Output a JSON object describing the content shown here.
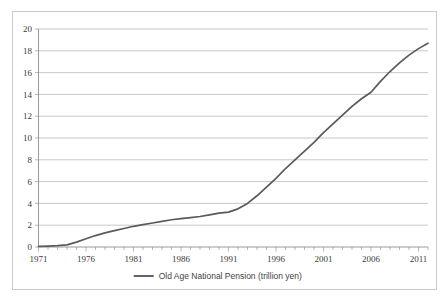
{
  "chart_data": {
    "type": "line",
    "title": "",
    "xlabel": "",
    "ylabel": "",
    "xlim": [
      1971,
      2012
    ],
    "ylim": [
      0,
      20
    ],
    "y_ticks": [
      0,
      2,
      4,
      6,
      8,
      10,
      12,
      14,
      16,
      18,
      20
    ],
    "x_tick_labels": [
      "1971",
      "1976",
      "1981",
      "1986",
      "1991",
      "1996",
      "2001",
      "2006",
      "2011"
    ],
    "x_tick_values": [
      1971,
      1976,
      1981,
      1986,
      1991,
      1996,
      2001,
      2006,
      2011
    ],
    "x_minor_tick_step": 1,
    "grid": "horizontal",
    "legend_position": "bottom-center",
    "series": [
      {
        "name": "Old Age National Pension (trillion yen)",
        "color": "#5a5a5a",
        "x": [
          1971,
          1972,
          1973,
          1974,
          1975,
          1976,
          1977,
          1978,
          1979,
          1980,
          1981,
          1982,
          1983,
          1984,
          1985,
          1986,
          1987,
          1988,
          1989,
          1990,
          1991,
          1992,
          1993,
          1994,
          1995,
          1996,
          1997,
          1998,
          1999,
          2000,
          2001,
          2002,
          2003,
          2004,
          2005,
          2006,
          2007,
          2008,
          2009,
          2010,
          2011,
          2012
        ],
        "values": [
          0.05,
          0.08,
          0.12,
          0.2,
          0.45,
          0.75,
          1.05,
          1.3,
          1.5,
          1.7,
          1.9,
          2.05,
          2.2,
          2.35,
          2.5,
          2.6,
          2.7,
          2.8,
          2.95,
          3.1,
          3.2,
          3.5,
          4.0,
          4.7,
          5.5,
          6.3,
          7.2,
          8.0,
          8.8,
          9.6,
          10.5,
          11.3,
          12.1,
          12.9,
          13.6,
          14.2,
          15.2,
          16.1,
          16.9,
          17.6,
          18.2,
          18.7
        ]
      }
    ]
  },
  "legend": {
    "entries": [
      {
        "label": "Old Age National Pension (trillion yen)",
        "color": "#5a5a5a"
      }
    ]
  },
  "axes": {
    "y_axis_label_values": [
      "20",
      "18",
      "16",
      "14",
      "12",
      "10",
      "8",
      "6",
      "4",
      "2",
      "0"
    ],
    "x_axis_label_values": [
      "1971",
      "1976",
      "1981",
      "1986",
      "1991",
      "1996",
      "2001",
      "2006",
      "2011"
    ]
  },
  "colors": {
    "series": "#5a5a5a",
    "gridline": "#b0b0b0",
    "axis": "#8f8f8f",
    "border": "#c9c9c9",
    "text": "#3a3a3a",
    "background": "#ffffff"
  }
}
